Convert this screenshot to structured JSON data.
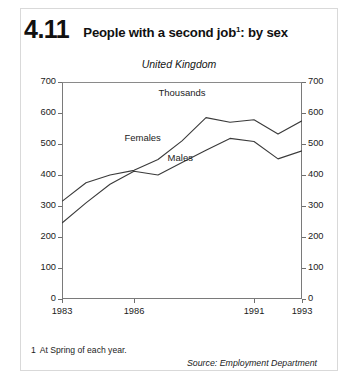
{
  "figure": {
    "number": "4.11",
    "title": "People with a second job",
    "title_footnote_marker": "1",
    "title_suffix": ": by sex"
  },
  "chart_data": {
    "type": "line",
    "subtitle": "United Kingdom",
    "ylabel": "Thousands",
    "xlabel": "",
    "ylim": [
      0,
      700
    ],
    "yticks": [
      0,
      100,
      200,
      300,
      400,
      500,
      600,
      700
    ],
    "ytick_labels": [
      "0",
      "100",
      "200",
      "300",
      "400",
      "500",
      "600",
      "700"
    ],
    "xlim": [
      1983,
      1993
    ],
    "xticks": [
      1983,
      1986,
      1991,
      1993
    ],
    "xtick_labels": [
      "1983",
      "1986",
      "1991",
      "1993"
    ],
    "x": [
      1983,
      1984,
      1985,
      1986,
      1987,
      1988,
      1989,
      1990,
      1991,
      1992,
      1993
    ],
    "grid": false,
    "legend_position": "inline-annotations",
    "series": [
      {
        "name": "Females",
        "values": [
          315,
          375,
          400,
          415,
          450,
          510,
          585,
          570,
          578,
          532,
          575
        ],
        "label_text": "Females",
        "color": "#3a3a3a"
      },
      {
        "name": "Males",
        "values": [
          245,
          310,
          370,
          412,
          400,
          440,
          480,
          518,
          508,
          452,
          478
        ],
        "label_text": "Males",
        "color": "#3a3a3a"
      }
    ],
    "annotations": [
      "Thousands"
    ]
  },
  "footnote": {
    "number": "1",
    "text": "At Spring of each year."
  },
  "source": {
    "text": "Source: Employment Department"
  }
}
